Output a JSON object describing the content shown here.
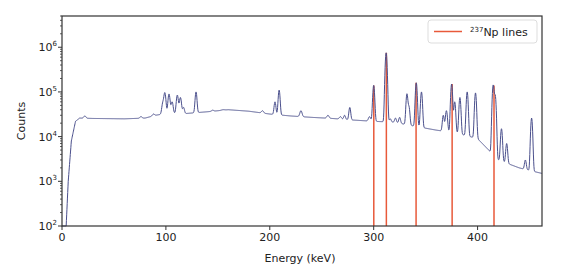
{
  "chart_data": {
    "type": "line",
    "title": "",
    "xlabel": "Energy (keV)",
    "ylabel": "Counts",
    "xlim": [
      0,
      462
    ],
    "ylim": [
      100,
      5000000
    ],
    "yscale": "log",
    "grid": false,
    "legend_position": "upper right",
    "x_ticks": [
      0,
      100,
      200,
      300,
      400
    ],
    "y_ticks": [
      {
        "value": 100,
        "label": "10",
        "exp": "2"
      },
      {
        "value": 1000,
        "label": "10",
        "exp": "3"
      },
      {
        "value": 10000,
        "label": "10",
        "exp": "4"
      },
      {
        "value": 100000,
        "label": "10",
        "exp": "5"
      },
      {
        "value": 1000000,
        "label": "10",
        "exp": "6"
      }
    ],
    "series": [
      {
        "name": "spectrum",
        "color": "#4a4f8c",
        "baseline": [
          [
            0,
            100
          ],
          [
            4,
            100
          ],
          [
            6,
            1000
          ],
          [
            9,
            8000
          ],
          [
            13,
            22000
          ],
          [
            17,
            26000
          ],
          [
            30,
            25500
          ],
          [
            60,
            25000
          ],
          [
            80,
            26000
          ],
          [
            90,
            30000
          ],
          [
            100,
            33000
          ],
          [
            120,
            33000
          ],
          [
            140,
            36000
          ],
          [
            160,
            40000
          ],
          [
            180,
            37000
          ],
          [
            200,
            32000
          ],
          [
            220,
            29000
          ],
          [
            240,
            27000
          ],
          [
            260,
            25500
          ],
          [
            280,
            23500
          ],
          [
            300,
            22000
          ],
          [
            320,
            21000
          ],
          [
            340,
            17000
          ],
          [
            360,
            14000
          ],
          [
            380,
            12000
          ],
          [
            400,
            9000
          ],
          [
            420,
            3000
          ],
          [
            440,
            2000
          ],
          [
            462,
            1500
          ]
        ],
        "peaks": [
          [
            22,
            29000,
            1.0
          ],
          [
            76,
            28000,
            1.0
          ],
          [
            88,
            32000,
            1.0
          ],
          [
            97,
            55000,
            0.9
          ],
          [
            99,
            95000,
            0.9
          ],
          [
            103,
            90000,
            0.9
          ],
          [
            106,
            60000,
            0.9
          ],
          [
            111,
            85000,
            0.9
          ],
          [
            114,
            75000,
            0.9
          ],
          [
            117,
            45000,
            0.8
          ],
          [
            129,
            100000,
            0.8
          ],
          [
            145,
            39000,
            1.0
          ],
          [
            155,
            40000,
            1.5
          ],
          [
            193,
            38000,
            1.0
          ],
          [
            205,
            60000,
            0.8
          ],
          [
            209,
            110000,
            0.8
          ],
          [
            230,
            38000,
            1.0
          ],
          [
            256,
            30000,
            1.0
          ],
          [
            268,
            28000,
            1.0
          ],
          [
            272,
            30000,
            0.8
          ],
          [
            277,
            45000,
            0.8
          ],
          [
            296,
            28000,
            1.0
          ],
          [
            300,
            140000,
            0.8
          ],
          [
            312,
            750000,
            0.8
          ],
          [
            316,
            25000,
            0.8
          ],
          [
            321,
            26000,
            0.8
          ],
          [
            325,
            27000,
            0.8
          ],
          [
            332,
            90000,
            0.8
          ],
          [
            334,
            45000,
            0.8
          ],
          [
            341,
            160000,
            0.8
          ],
          [
            346,
            100000,
            0.8
          ],
          [
            367,
            30000,
            0.8
          ],
          [
            370,
            38000,
            0.9
          ],
          [
            375,
            150000,
            0.8
          ],
          [
            378,
            60000,
            0.8
          ],
          [
            383,
            75000,
            0.8
          ],
          [
            390,
            100000,
            0.8
          ],
          [
            398,
            95000,
            0.8
          ],
          [
            415,
            140000,
            0.8
          ],
          [
            417,
            80000,
            0.8
          ],
          [
            423,
            15000,
            0.8
          ],
          [
            428,
            7000,
            0.8
          ],
          [
            446,
            3000,
            0.8
          ],
          [
            452,
            26000,
            0.8
          ]
        ]
      }
    ],
    "vlines": {
      "name": "237Np lines",
      "color": "#e8593a",
      "x": [
        300.1,
        312.2,
        340.8,
        375.5,
        415.8
      ]
    },
    "legend": [
      {
        "label_sup": "237",
        "label": "Np lines",
        "color": "#e8593a"
      }
    ]
  },
  "legend": {
    "sup": "237",
    "text": "Np lines"
  },
  "axes": {
    "xlabel": "Energy (keV)",
    "ylabel": "Counts"
  }
}
